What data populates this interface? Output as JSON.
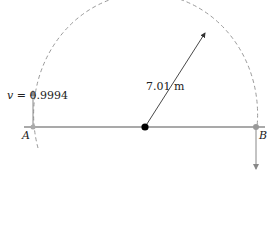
{
  "diagram": {
    "velocity_label": {
      "symbol": "v",
      "equals": " = ",
      "value": "0.9994"
    },
    "radius_label": "7.01 m",
    "point_a_label": "A",
    "point_b_label": "B",
    "colors": {
      "arc": "#9a9a9a",
      "line": "#555555",
      "center_dot": "#000000",
      "arrows": "#8a8a8a"
    }
  }
}
